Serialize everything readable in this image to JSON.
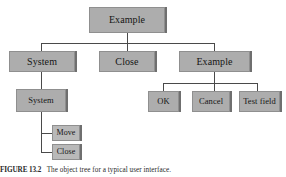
{
  "figure": {
    "type": "hierarchical-tree-diagram",
    "background_color": "#ffffff",
    "node_fill_color": "#adadad",
    "node_border_color": "#8f8f8f",
    "node_shadow_color": "#6f6f6f",
    "connector_color": "#4a4a4a"
  },
  "nodes": {
    "root": {
      "label": "Example"
    },
    "level2": [
      {
        "label": "System"
      },
      {
        "label": "Close"
      },
      {
        "label": "Example"
      }
    ],
    "level3_left": {
      "label": "System"
    },
    "level3_right": [
      {
        "label": "OK"
      },
      {
        "label": "Cancel"
      },
      {
        "label": "Test field"
      }
    ],
    "level4_left": [
      {
        "label": "Move"
      },
      {
        "label": "Close"
      }
    ]
  },
  "caption": {
    "figure_number": "FIGURE 13.2",
    "text": "The object tree for a typical user interface."
  }
}
